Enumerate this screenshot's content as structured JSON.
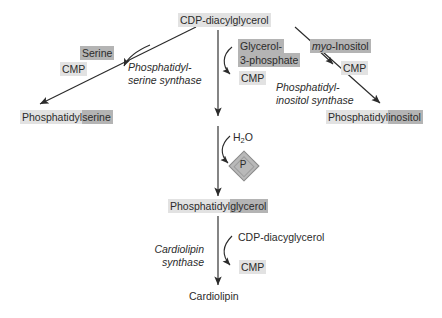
{
  "diagram": {
    "colors": {
      "background": "#ffffff",
      "stroke": "#2b2b2b",
      "highlight_light": "#e2e2e2",
      "highlight_dark": "#b4b4b4",
      "phosphate_fill": "#b9b9b9"
    },
    "nodes": {
      "precursor": {
        "text": "CDP-diacylglycerol",
        "highlight": "light"
      },
      "product_serine": {
        "prefix": "Phosphatidyl",
        "suffix": "serine",
        "prefix_highlight": "light",
        "suffix_highlight": "dark"
      },
      "product_glycerol": {
        "prefix": "Phosphatidyl",
        "suffix": "glycerol",
        "prefix_highlight": "light",
        "suffix_highlight": "dark"
      },
      "product_inositol": {
        "prefix": "Phosphatidyl",
        "suffix": "inositol",
        "prefix_highlight": "light",
        "suffix_highlight": "dark"
      },
      "product_cardiolipin": {
        "text": "Cardiolipin",
        "highlight": "none"
      }
    },
    "substrates": {
      "serine": {
        "text": "Serine",
        "highlight": "dark"
      },
      "glycerol_3_phosphate_line1": {
        "text": "Glycerol-",
        "highlight": "dark"
      },
      "glycerol_3_phosphate_line2": {
        "text": "3-phosphate",
        "highlight": "dark"
      },
      "myo_inositol_italic": {
        "text": "myo-"
      },
      "myo_inositol_roman": {
        "text": "Inositol"
      },
      "water": {
        "text": "H",
        "subscript": "2",
        "text_tail": "O"
      },
      "cdp_diacyglycerol_lower": {
        "text": "CDP-diacyglycerol",
        "highlight": "none"
      }
    },
    "byproducts": {
      "cmp_left": {
        "text": "CMP",
        "highlight": "light"
      },
      "cmp_center": {
        "text": "CMP",
        "highlight": "light"
      },
      "cmp_right": {
        "text": "CMP",
        "highlight": "light"
      },
      "cmp_bottom": {
        "text": "CMP",
        "highlight": "light"
      },
      "phosphate": {
        "text": "P",
        "shape": "diamond"
      }
    },
    "enzymes": {
      "ps_synthase": {
        "line1": "Phosphatidyl-",
        "line2": "serine synthase"
      },
      "pi_synthase": {
        "line1": "Phosphatidyl-",
        "line2": "inositol synthase"
      },
      "cardiolipin_synthase": {
        "line1": "Cardiolipin",
        "line2": "synthase"
      }
    }
  }
}
